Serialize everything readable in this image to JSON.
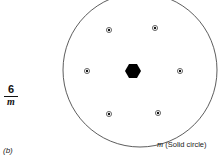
{
  "symbol": {
    "numerator": "6",
    "denominator": "m"
  },
  "caption": "(b)",
  "mirror_label": {
    "symbol": "m",
    "text": " (Solid circle)"
  },
  "colors": {
    "ink": "#111111",
    "background": "#ffffff"
  },
  "circle": {
    "cx": 140,
    "cy": 70,
    "r": 77
  },
  "center_axis": {
    "type": "hexagon",
    "cx": 133,
    "cy": 71,
    "size": 8
  },
  "points": [
    {
      "cx": 109,
      "cy": 30
    },
    {
      "cx": 155,
      "cy": 28
    },
    {
      "cx": 87,
      "cy": 71
    },
    {
      "cx": 180,
      "cy": 71
    },
    {
      "cx": 109,
      "cy": 114
    },
    {
      "cx": 158,
      "cy": 113
    }
  ]
}
